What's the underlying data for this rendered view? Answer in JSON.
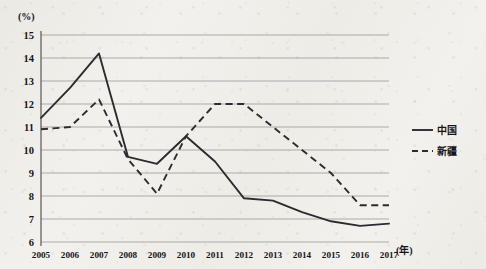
{
  "chart_data": {
    "type": "line",
    "title": "",
    "xlabel": "(年)",
    "ylabel": "(%)",
    "ylim": [
      6,
      15
    ],
    "yticks": [
      6,
      7,
      8,
      9,
      10,
      11,
      12,
      13,
      14,
      15
    ],
    "grid": true,
    "legend_position": "right",
    "categories": [
      "2005",
      "2006",
      "2007",
      "2008",
      "2009",
      "2010",
      "2011",
      "2012",
      "2013",
      "2014",
      "2015",
      "2016",
      "2017"
    ],
    "series": [
      {
        "name": "中国",
        "style": "solid",
        "color": "#2b2b30",
        "values": [
          11.4,
          12.7,
          14.2,
          9.7,
          9.4,
          10.6,
          9.5,
          7.9,
          7.8,
          7.3,
          6.9,
          6.7,
          6.8
        ]
      },
      {
        "name": "新疆",
        "style": "dashed",
        "color": "#2b2b30",
        "values": [
          10.9,
          11.0,
          12.2,
          9.6,
          8.1,
          10.6,
          12.0,
          12.0,
          11.0,
          10.0,
          9.0,
          7.6,
          7.6
        ]
      }
    ]
  },
  "axis": {
    "y_unit_label": "(%)",
    "x_unit_label": "(年)"
  },
  "legend": {
    "items": [
      {
        "label": "中国",
        "style": "solid"
      },
      {
        "label": "新疆",
        "style": "dashed"
      }
    ]
  }
}
